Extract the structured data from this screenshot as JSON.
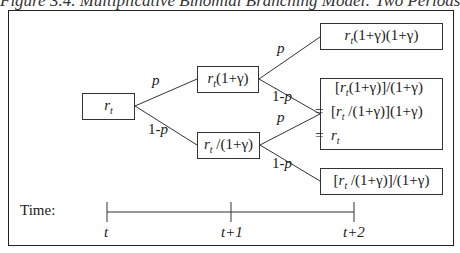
{
  "figure": {
    "title": "Figure 3.4. Multiplicative Binomial Branching Model: Two Periods"
  },
  "nodes": {
    "root": "r_t",
    "up": "r_t(1+γ)",
    "down": "r_t /(1+γ)",
    "up_up": "r_t(1+γ)(1+γ)",
    "middle": {
      "line1": "[r_t(1+γ)]/(1+γ)",
      "line2": "= [r_t /(1+γ)](1+γ)",
      "line3": "= r_t"
    },
    "down_down": "[r_t /(1+γ)]/(1+γ)"
  },
  "edges": {
    "root_up": "p",
    "root_down": "1-p",
    "up_up": "p",
    "up_down": "1-p",
    "down_up": "p",
    "down_down": "1-p"
  },
  "timeline": {
    "label": "Time:",
    "ticks": [
      "t",
      "t+1",
      "t+2"
    ]
  }
}
